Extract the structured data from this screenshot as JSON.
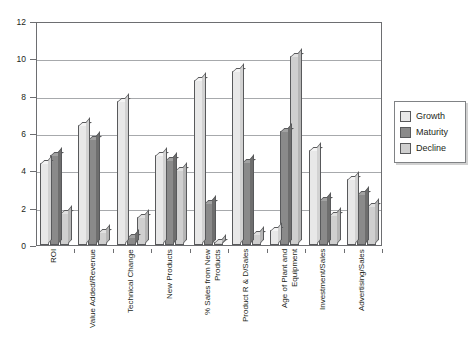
{
  "chart_data": {
    "type": "bar",
    "title": "",
    "xlabel": "",
    "ylabel": "",
    "ylim": [
      0,
      12
    ],
    "yticks": [
      0,
      2,
      4,
      6,
      8,
      10,
      12
    ],
    "grid": true,
    "legend_position": "right",
    "categories": [
      "ROI",
      "Value Added/Revenue",
      "Technical Change",
      "New Products",
      "% Sales from New Products",
      "Product R & D/Sales",
      "Age of Plant and Equipment",
      "Investment/Sales",
      "Advertising/Sales"
    ],
    "series": [
      {
        "name": "Growth",
        "color": "#e8e8e8",
        "values": [
          4.4,
          6.45,
          7.7,
          4.8,
          8.85,
          9.3,
          0.8,
          5.1,
          3.55
        ]
      },
      {
        "name": "Maturity",
        "color": "#8a8a8a",
        "values": [
          4.8,
          5.7,
          0.45,
          4.55,
          2.25,
          4.45,
          6.1,
          2.4,
          2.75
        ]
      },
      {
        "name": "Decline",
        "color": "#cfcfcf",
        "values": [
          1.7,
          0.7,
          1.5,
          4.0,
          0.15,
          0.6,
          10.1,
          1.6,
          2.1
        ]
      }
    ]
  },
  "legend": {
    "items": [
      {
        "label": "Growth",
        "swatch": "#e8e8e8"
      },
      {
        "label": "Maturity",
        "swatch": "#8a8a8a"
      },
      {
        "label": "Decline",
        "swatch": "#cfcfcf"
      }
    ]
  },
  "axis": {
    "y_tick_labels": [
      "0",
      "2",
      "4",
      "6",
      "8",
      "10",
      "12"
    ]
  },
  "colors": {
    "frame": "#6d6e71",
    "gridline": "#a7a9ac",
    "text": "#231f20",
    "background": "#ffffff"
  }
}
